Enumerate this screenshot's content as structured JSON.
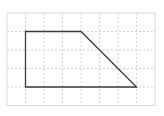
{
  "diagram": {
    "type": "grid-shape",
    "grid": {
      "columns": 8,
      "rows": 5,
      "origin_px": [
        7,
        13
      ],
      "cell_px": 18.5,
      "border_color": "#d9d9d9",
      "line_color": "#d4d4d4",
      "line_style": "dotted"
    },
    "shape": {
      "name": "trapezoid",
      "vertices_grid": [
        [
          1,
          1
        ],
        [
          4,
          1
        ],
        [
          7,
          4
        ],
        [
          1,
          4
        ]
      ],
      "stroke_color": "#3a3a3a",
      "stroke_width": 1.3,
      "fill": "none"
    }
  }
}
